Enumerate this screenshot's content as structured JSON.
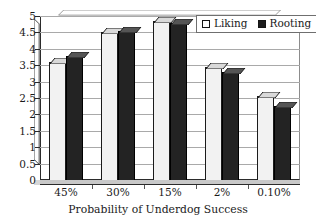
{
  "chart_data": {
    "type": "bar",
    "title": "",
    "subtitle": "",
    "xlabel": "Probability of Underdog Success",
    "ylabel": "",
    "categories": [
      "45%",
      "30%",
      "15%",
      "2%",
      "0.10%"
    ],
    "series": [
      {
        "name": "Liking",
        "values": [
          3.6,
          4.5,
          4.85,
          3.45,
          2.55
        ],
        "color": "#f2f2f2"
      },
      {
        "name": "Rooting",
        "values": [
          3.78,
          4.55,
          4.78,
          3.3,
          2.25
        ],
        "color": "#232323"
      }
    ],
    "ylim": [
      0,
      5
    ],
    "ytick_labels": [
      "5",
      "4.5",
      "4",
      "3.5",
      "3",
      "2.5",
      "2",
      "1.5",
      "1",
      "0.5",
      "0"
    ],
    "ytick_values": [
      5,
      4.5,
      4,
      3.5,
      3,
      2.5,
      2,
      1.5,
      1,
      0.5,
      0
    ],
    "grid": true,
    "grid_axis": "y",
    "legend_position": "top-right",
    "style": "3d-columns"
  },
  "legend": {
    "items": [
      {
        "label": "Liking",
        "swatch": "white-square-icon"
      },
      {
        "label": "Rooting",
        "swatch": "black-square-icon"
      }
    ]
  },
  "axes": {
    "x_title": "Probability of Underdog Success",
    "y_ticks": [
      "5",
      "4.5",
      "4",
      "3.5",
      "3",
      "2.5",
      "2",
      "1.5",
      "1",
      "0.5",
      "0"
    ],
    "x_ticks": [
      "45%",
      "30%",
      "15%",
      "2%",
      "0.10%"
    ]
  },
  "colors": {
    "liking_fill": "#f2f2f2",
    "rooting_fill": "#232323",
    "gridline": "#a9a9a9",
    "axis": "#2b2b2b",
    "background": "#ffffff"
  }
}
